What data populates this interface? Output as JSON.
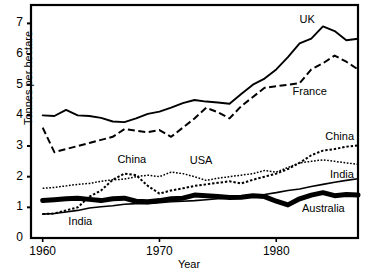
{
  "chart_data": {
    "type": "line",
    "title": "",
    "xlabel": "Year",
    "ylabel": "Tonnes per hectare",
    "xlim": [
      1959,
      1987
    ],
    "ylim": [
      0,
      7.6
    ],
    "xticks": [
      1960,
      1970,
      1980
    ],
    "yticks": [
      0,
      1,
      2,
      3,
      4,
      5,
      6,
      7
    ],
    "grid": false,
    "legend_position": "inline-annotations",
    "x": [
      1960,
      1961,
      1962,
      1963,
      1964,
      1965,
      1966,
      1967,
      1968,
      1969,
      1970,
      1971,
      1972,
      1973,
      1974,
      1975,
      1976,
      1977,
      1978,
      1979,
      1980,
      1981,
      1982,
      1983,
      1984,
      1985,
      1986,
      1987
    ],
    "series": [
      {
        "name": "UK",
        "style": "solid",
        "values": [
          4.0,
          3.98,
          4.18,
          4.0,
          3.98,
          3.92,
          3.8,
          3.78,
          3.9,
          4.05,
          4.12,
          4.25,
          4.4,
          4.5,
          4.45,
          4.42,
          4.38,
          4.7,
          5.0,
          5.2,
          5.5,
          5.9,
          6.35,
          6.5,
          6.9,
          6.75,
          6.45,
          6.5
        ]
      },
      {
        "name": "France",
        "style": "dashed",
        "values": [
          3.6,
          2.8,
          2.9,
          3.0,
          3.1,
          3.2,
          3.3,
          3.55,
          3.5,
          3.45,
          3.52,
          3.3,
          3.6,
          3.9,
          4.25,
          4.1,
          3.9,
          4.3,
          4.6,
          4.9,
          4.95,
          5.0,
          5.05,
          5.5,
          5.7,
          5.95,
          5.75,
          5.5
        ]
      },
      {
        "name": "USA",
        "style": "dotted-fine",
        "values": [
          1.62,
          1.65,
          1.7,
          1.75,
          1.78,
          1.85,
          1.9,
          1.92,
          2.0,
          2.05,
          2.0,
          2.15,
          2.1,
          2.0,
          1.88,
          1.95,
          2.0,
          2.05,
          2.1,
          2.2,
          2.15,
          2.3,
          2.45,
          2.5,
          2.55,
          2.5,
          2.45,
          2.4
        ]
      },
      {
        "name": "China",
        "style": "dotted",
        "values": [
          0.78,
          0.8,
          0.9,
          1.0,
          1.35,
          1.55,
          1.9,
          2.1,
          2.05,
          1.7,
          1.45,
          1.55,
          1.62,
          1.7,
          1.75,
          1.8,
          1.85,
          1.78,
          1.9,
          2.0,
          2.1,
          2.25,
          2.45,
          2.7,
          2.85,
          2.9,
          2.98,
          3.02
        ]
      },
      {
        "name": "India",
        "style": "thin-solid",
        "values": [
          0.78,
          0.8,
          0.85,
          0.9,
          0.98,
          1.02,
          1.05,
          1.1,
          1.12,
          1.12,
          1.15,
          1.18,
          1.2,
          1.22,
          1.25,
          1.28,
          1.3,
          1.35,
          1.4,
          1.42,
          1.48,
          1.55,
          1.6,
          1.68,
          1.75,
          1.82,
          1.88,
          1.93
        ]
      },
      {
        "name": "Australia",
        "style": "thick-solid",
        "values": [
          1.22,
          1.25,
          1.28,
          1.3,
          1.26,
          1.22,
          1.28,
          1.3,
          1.2,
          1.18,
          1.22,
          1.28,
          1.3,
          1.4,
          1.38,
          1.35,
          1.32,
          1.33,
          1.38,
          1.35,
          1.2,
          1.08,
          1.28,
          1.4,
          1.48,
          1.38,
          1.42,
          1.4
        ]
      }
    ],
    "annotations": [
      {
        "text": "UK",
        "x": 1982.0,
        "y": 7.1
      },
      {
        "text": "France",
        "x": 1981.4,
        "y": 4.75
      },
      {
        "text": "China",
        "x": 1984.2,
        "y": 3.3
      },
      {
        "text": "India",
        "x": 1984.6,
        "y": 2.05
      },
      {
        "text": "Australia",
        "x": 1982.2,
        "y": 0.95
      },
      {
        "text": "China",
        "x": 1966.4,
        "y": 2.55
      },
      {
        "text": "USA",
        "x": 1972.6,
        "y": 2.5
      },
      {
        "text": "India",
        "x": 1962.2,
        "y": 0.52
      }
    ],
    "colors": {
      "line": "#000000",
      "axis": "#000000",
      "background": "#ffffff"
    }
  }
}
